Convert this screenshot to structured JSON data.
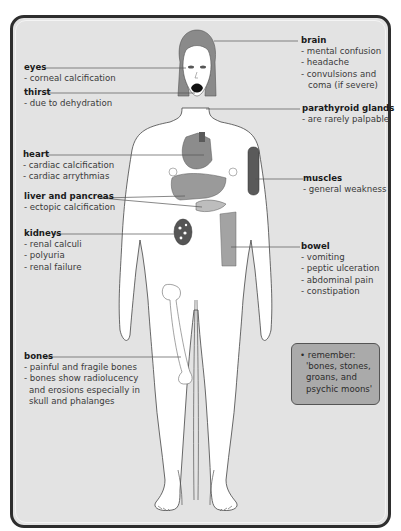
{
  "diagram": {
    "type": "anatomical-annotated-figure",
    "labels": {
      "eyes": {
        "title": "eyes",
        "items": [
          "- corneal calcification"
        ]
      },
      "thirst": {
        "title": "thirst",
        "items": [
          "- due to dehydration"
        ]
      },
      "brain": {
        "title": "brain",
        "items": [
          "- mental confusion",
          "- headache",
          "-  convulsions and",
          "   coma (if severe)"
        ]
      },
      "parathyroid": {
        "title": "parathyroid glands",
        "items": [
          "- are rarely palpable"
        ]
      },
      "heart": {
        "title": "heart",
        "items": [
          "- cardiac calcification",
          "- cardiac arrythmias"
        ]
      },
      "liver": {
        "title": "liver and pancreas",
        "items": [
          "- ectopic calcification"
        ]
      },
      "muscles": {
        "title": "muscles",
        "items": [
          "- general weakness"
        ]
      },
      "kidneys": {
        "title": "kidneys",
        "items": [
          "- renal calculi",
          "- polyuria",
          "- renal failure"
        ]
      },
      "bowel": {
        "title": "bowel",
        "items": [
          "- vomiting",
          "- peptic ulceration",
          "- abdominal pain",
          "- constipation"
        ]
      },
      "bones": {
        "title": "bones",
        "items": [
          "- painful and fragile bones",
          "- bones show radiolucency",
          "  and erosions especially in",
          "  skull and phalanges"
        ]
      }
    },
    "remember_box": {
      "lines": [
        "• remember:",
        "  'bones, stones,",
        "  groans, and",
        "  psychic moons'"
      ]
    },
    "colors": {
      "panel_background": "#e3e3e3",
      "panel_border": "#2e2e2e",
      "organ_fill": "#8c8c8c",
      "organ_dark": "#5a5a5a",
      "hair": "#8a8a8a",
      "remember_box": "#aaaaaa"
    }
  }
}
